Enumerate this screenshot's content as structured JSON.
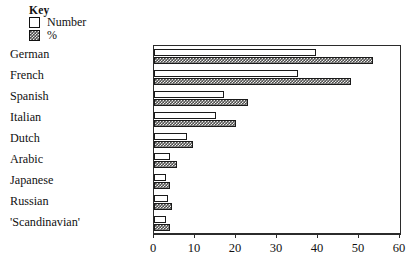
{
  "legend": {
    "title": "Key",
    "entries": [
      {
        "label": "Number",
        "swatch": "open-square-icon",
        "style": "number"
      },
      {
        "label": "%",
        "swatch": "hatched-square-icon",
        "style": "pct"
      }
    ]
  },
  "chart_data": {
    "type": "bar",
    "orientation": "horizontal",
    "title": "",
    "xlabel": "",
    "ylabel": "",
    "xlim": [
      0,
      60
    ],
    "xticks": [
      0,
      10,
      20,
      30,
      40,
      50,
      60
    ],
    "grid": false,
    "legend_position": "top-left",
    "categories": [
      "German",
      "French",
      "Spanish",
      "Italian",
      "Dutch",
      "Arabic",
      "Japanese",
      "Russian",
      "'Scandinavian'"
    ],
    "series": [
      {
        "name": "Number",
        "values": [
          39.5,
          35,
          17,
          15,
          8,
          4,
          3,
          3.5,
          3
        ]
      },
      {
        "name": "%",
        "values": [
          53.5,
          48,
          23,
          20,
          9.5,
          5.5,
          4,
          4.5,
          4
        ]
      }
    ]
  },
  "colors": {
    "axis": "#2b2b2b",
    "bar_number_fill": "#ffffff",
    "bar_pct_fill": "#50504e",
    "text": "#111111"
  }
}
